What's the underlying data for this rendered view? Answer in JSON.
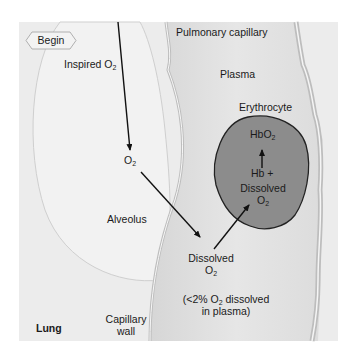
{
  "diagram": {
    "begin_label": "Begin",
    "labels": {
      "inspired_o2": "Inspired O",
      "inspired_o2_sub": "2",
      "pulmonary_capillary": "Pulmonary capillary",
      "plasma": "Plasma",
      "erythrocyte": "Erythrocyte",
      "hbo2": "HbO",
      "hbo2_sub": "2",
      "hb_plus": "Hb +",
      "dissolved_rbc": "Dissolved",
      "dissolved_rbc_o2": "O",
      "dissolved_rbc_o2_sub": "2",
      "o2_alveolar": "O",
      "o2_alveolar_sub": "2",
      "alveolus": "Alveolus",
      "dissolved_plasma": "Dissolved",
      "dissolved_plasma_o2": "O",
      "dissolved_plasma_o2_sub": "2",
      "plasma_note_line1_pre": "(<2% O",
      "plasma_note_line1_sub": "2",
      "plasma_note_line1_post": " dissolved",
      "plasma_note_line2": "in plasma)",
      "lung": "Lung",
      "capillary_wall_line1": "Capillary",
      "capillary_wall_line2": "wall"
    },
    "colors": {
      "background": "#ededed",
      "alveolus_fill": "#f1f1f1",
      "capillary_fill": "#e2e2e2",
      "erythrocyte_fill": "#8c8c8c",
      "arrow": "#111111"
    }
  }
}
